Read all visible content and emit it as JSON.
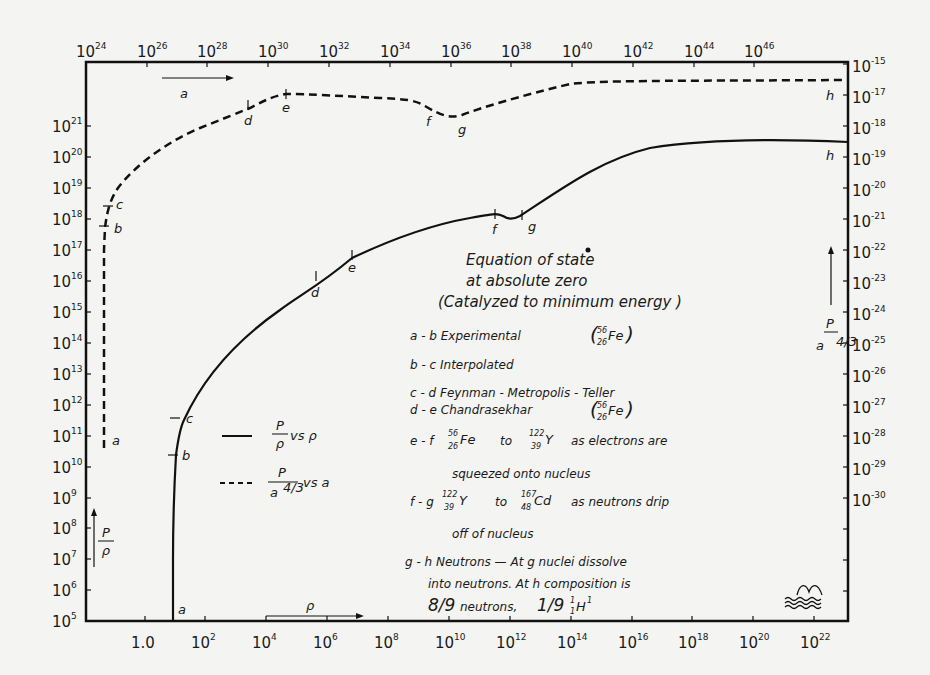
{
  "chart_data": {
    "type": "line",
    "title_lines": [
      "Equation   of   state",
      "at   absolute   zero",
      "(Catalyzed  to  minimum  energy )"
    ],
    "xlabel_bottom": "ρ",
    "xlabel_top": "a",
    "ylabel_left": "P/ρ",
    "ylabel_right": "P/a^4/3",
    "x_bottom_ticks": [
      "1.0",
      "10^2",
      "10^4",
      "10^6",
      "10^8",
      "10^10",
      "10^12",
      "10^14",
      "10^16",
      "10^18",
      "10^20",
      "10^22"
    ],
    "x_top_ticks": [
      "10^24",
      "10^26",
      "10^28",
      "10^30",
      "10^32",
      "10^34",
      "10^36",
      "10^38",
      "10^40",
      "10^42",
      "10^44",
      "10^46"
    ],
    "y_left_ticks": [
      "10^5",
      "10^6",
      "10^7",
      "10^8",
      "10^9",
      "10^10",
      "10^11",
      "10^12",
      "10^13",
      "10^14",
      "10^15",
      "10^16",
      "10^17",
      "10^18",
      "10^19",
      "10^20",
      "10^21"
    ],
    "y_right_ticks": [
      "10^-15",
      "10^-17",
      "10^-18",
      "10^-19",
      "10^-20",
      "10^-21",
      "10^-22",
      "10^-23",
      "10^-24",
      "10^-25",
      "10^-26",
      "10^-27",
      "10^-28",
      "10^-29",
      "10^-30"
    ],
    "xscale": "log",
    "yscale": "log",
    "grid": false,
    "series": [
      {
        "name": "P/ρ vs ρ",
        "style": "solid",
        "axis_x": "bottom (ρ)",
        "axis_y": "left (P/ρ)",
        "points": [
          {
            "label": "a",
            "log_x": 0.35,
            "log_y": 5.0
          },
          {
            "label": "b",
            "log_x": 0.4,
            "log_y": 10.3
          },
          {
            "label": "c",
            "log_x": 0.6,
            "log_y": 11.4
          },
          {
            "label": "d",
            "log_x": 4.0,
            "log_y": 16.2
          },
          {
            "label": "e",
            "log_x": 6.7,
            "log_y": 16.6
          },
          {
            "label": "f",
            "log_x": 11.5,
            "log_y": 18.2
          },
          {
            "label": "g",
            "log_x": 12.0,
            "log_y": 18.0
          },
          {
            "label": "h",
            "log_x": 22.9,
            "log_y": 20.3
          }
        ]
      },
      {
        "name": "P/a^4/3 vs a",
        "style": "dashed",
        "axis_x": "top (a)",
        "axis_y": "right (P/a^4/3)",
        "points": [
          {
            "label": "a",
            "log_x": 24.6,
            "log_y": -28.3
          },
          {
            "label": "b",
            "log_x": 24.6,
            "log_y": -21.8
          },
          {
            "label": "c",
            "log_x": 24.7,
            "log_y": -21.3
          },
          {
            "label": "d",
            "log_x": 29.5,
            "log_y": -17.4
          },
          {
            "label": "e",
            "log_x": 30.6,
            "log_y": -17.0
          },
          {
            "label": "f",
            "log_x": 35.5,
            "log_y": -17.8
          },
          {
            "label": "g",
            "log_x": 36.4,
            "log_y": -18.0
          },
          {
            "label": "h",
            "log_x": 48.9,
            "log_y": -16.6
          }
        ]
      }
    ],
    "legend": [
      {
        "style": "solid",
        "label": "P/ρ vs ρ"
      },
      {
        "style": "dashed",
        "label": "P/a^4/3 vs a"
      }
    ],
    "annotations": [
      {
        "range": "a - b",
        "text": "Experimental",
        "nuclide": "56/26 Fe"
      },
      {
        "range": "b - c",
        "text": "Interpolated"
      },
      {
        "range": "c - d",
        "text": "Feynman - Metropolis - Teller"
      },
      {
        "range": "d - e",
        "text": "Chandrasekhar",
        "nuclide": "56/26 Fe"
      },
      {
        "range": "e - f",
        "text": "56/26 Fe to 122/39 Y as electrons are squeezed onto nucleus"
      },
      {
        "range": "f - g",
        "text": "122/39 Y to 167/48 Cd as neutrons drip off of nucleus"
      },
      {
        "range": "g - h",
        "text": "Neutrons — At g nuclei dissolve into neutrons. At h composition is 8/9 neutrons, 1/9 1/1 H^1"
      }
    ]
  },
  "labels": {
    "bottom_axis_var": "ρ",
    "top_axis_var": "a",
    "left_axis_num": "P",
    "left_axis_den": "ρ",
    "right_axis_num": "P",
    "right_axis_den": "a",
    "right_axis_den_exp": "4/3",
    "legend_solid_num": "P",
    "legend_solid_den": "ρ",
    "legend_solid_vs": "vs ρ",
    "legend_dashed_num": "P",
    "legend_dashed_den": "a",
    "legend_dashed_exp": "4/3",
    "legend_dashed_vs": "vs  a",
    "title1": "Equation   of   state",
    "title2": "at   absolute   zero",
    "title3": "(Catalyzed  to  minimum  energy )",
    "ab": "a - b  Experimental",
    "bc": "b - c  Interpolated",
    "cd": "c - d  Feynman - Metropolis  -  Teller",
    "de": "d - e  Chandrasekhar",
    "ef_pre": "e - f",
    "ef_mid": "to",
    "ef_post": "as  electrons   are",
    "ef2": "squeezed  onto  nucleus",
    "fg_pre": "f - g",
    "fg_mid": "to",
    "fg_post": "as neutrons  drip",
    "fg2": "off  of  nucleus",
    "gh1": "g - h  Neutrons  — At  g  nuclei  dissolve",
    "gh2": "into  neutrons.  At  h   composition  is",
    "gh3_a": "8/9",
    "gh3_b": "neutrons,",
    "gh3_c": "1/9",
    "Fe": "Fe",
    "Y": "Y",
    "Cd": "Cd",
    "H": "H",
    "n56": "56",
    "z26": "26",
    "n122": "122",
    "z39": "39",
    "n167": "167",
    "z48": "48",
    "one": "1",
    "pt_a": "a",
    "pt_b": "b",
    "pt_c": "c",
    "pt_d": "d",
    "pt_e": "e",
    "pt_f": "f",
    "pt_g": "g",
    "pt_h": "h"
  },
  "ticks": {
    "bottom": [
      {
        "x": 145,
        "base": "1.0",
        "exp": ""
      },
      {
        "x": 205,
        "base": "10",
        "exp": "2"
      },
      {
        "x": 266,
        "base": "10",
        "exp": "4"
      },
      {
        "x": 327,
        "base": "10",
        "exp": "6"
      },
      {
        "x": 388,
        "base": "10",
        "exp": "8"
      },
      {
        "x": 449,
        "base": "10",
        "exp": "10"
      },
      {
        "x": 510,
        "base": "10",
        "exp": "12"
      },
      {
        "x": 571,
        "base": "10",
        "exp": "14"
      },
      {
        "x": 632,
        "base": "10",
        "exp": "16"
      },
      {
        "x": 692,
        "base": "10",
        "exp": "18"
      },
      {
        "x": 753,
        "base": "10",
        "exp": "20"
      },
      {
        "x": 814,
        "base": "10",
        "exp": "22"
      }
    ],
    "top": [
      {
        "x": 86,
        "exp": "24"
      },
      {
        "x": 147,
        "exp": "26"
      },
      {
        "x": 207,
        "exp": "28"
      },
      {
        "x": 268,
        "exp": "30"
      },
      {
        "x": 329,
        "exp": "32"
      },
      {
        "x": 390,
        "exp": "34"
      },
      {
        "x": 451,
        "exp": "36"
      },
      {
        "x": 511,
        "exp": "38"
      },
      {
        "x": 572,
        "exp": "40"
      },
      {
        "x": 633,
        "exp": "42"
      },
      {
        "x": 694,
        "exp": "44"
      },
      {
        "x": 754,
        "exp": "46"
      }
    ],
    "left": [
      {
        "y": 621,
        "exp": "5"
      },
      {
        "y": 590,
        "exp": "6"
      },
      {
        "y": 559,
        "exp": "7"
      },
      {
        "y": 528,
        "exp": "8"
      },
      {
        "y": 498,
        "exp": "9"
      },
      {
        "y": 467,
        "exp": "10"
      },
      {
        "y": 436,
        "exp": "11"
      },
      {
        "y": 405,
        "exp": "12"
      },
      {
        "y": 374,
        "exp": "13"
      },
      {
        "y": 343,
        "exp": "14"
      },
      {
        "y": 312,
        "exp": "15"
      },
      {
        "y": 281,
        "exp": "16"
      },
      {
        "y": 250,
        "exp": "17"
      },
      {
        "y": 219,
        "exp": "18"
      },
      {
        "y": 188,
        "exp": "19"
      },
      {
        "y": 157,
        "exp": "20"
      },
      {
        "y": 126,
        "exp": "21"
      }
    ],
    "right": [
      {
        "y": 64,
        "exp": "-15"
      },
      {
        "y": 95,
        "exp": "-17"
      },
      {
        "y": 126,
        "exp": "-18"
      },
      {
        "y": 157,
        "exp": "-19"
      },
      {
        "y": 188,
        "exp": "-20"
      },
      {
        "y": 219,
        "exp": "-21"
      },
      {
        "y": 250,
        "exp": "-22"
      },
      {
        "y": 281,
        "exp": "-23"
      },
      {
        "y": 312,
        "exp": "-24"
      },
      {
        "y": 343,
        "exp": "-25"
      },
      {
        "y": 374,
        "exp": "-26"
      },
      {
        "y": 405,
        "exp": "-27"
      },
      {
        "y": 436,
        "exp": "-28"
      },
      {
        "y": 467,
        "exp": "-29"
      },
      {
        "y": 498,
        "exp": "-30"
      }
    ]
  }
}
